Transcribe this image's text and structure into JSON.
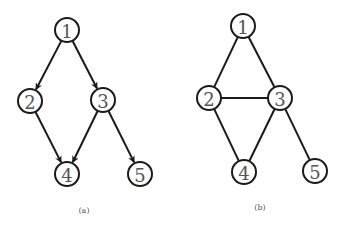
{
  "node_radius": 12,
  "colors": {
    "stroke": "#1a1a1a",
    "label": "#555555",
    "background": "#ffffff"
  },
  "graphs": [
    {
      "caption": "(a)",
      "caption_pos": [
        84,
        213
      ],
      "directed": true,
      "nodes": [
        {
          "id": "1",
          "label": "1",
          "x": 67,
          "y": 30
        },
        {
          "id": "2",
          "label": "2",
          "x": 30,
          "y": 101
        },
        {
          "id": "3",
          "label": "3",
          "x": 103,
          "y": 100
        },
        {
          "id": "4",
          "label": "4",
          "x": 67,
          "y": 174
        },
        {
          "id": "5",
          "label": "5",
          "x": 140,
          "y": 174
        }
      ],
      "edges": [
        {
          "from": "1",
          "to": "2"
        },
        {
          "from": "1",
          "to": "3"
        },
        {
          "from": "2",
          "to": "4"
        },
        {
          "from": "3",
          "to": "4"
        },
        {
          "from": "3",
          "to": "5"
        }
      ]
    },
    {
      "caption": "(b)",
      "caption_pos": [
        260,
        210
      ],
      "directed": false,
      "nodes": [
        {
          "id": "1",
          "label": "1",
          "x": 243,
          "y": 26
        },
        {
          "id": "2",
          "label": "2",
          "x": 209,
          "y": 98
        },
        {
          "id": "3",
          "label": "3",
          "x": 280,
          "y": 98
        },
        {
          "id": "4",
          "label": "4",
          "x": 244,
          "y": 172
        },
        {
          "id": "5",
          "label": "5",
          "x": 315,
          "y": 171
        }
      ],
      "edges": [
        {
          "from": "1",
          "to": "2"
        },
        {
          "from": "1",
          "to": "3"
        },
        {
          "from": "2",
          "to": "3"
        },
        {
          "from": "2",
          "to": "4"
        },
        {
          "from": "3",
          "to": "4"
        },
        {
          "from": "3",
          "to": "5"
        }
      ]
    }
  ]
}
